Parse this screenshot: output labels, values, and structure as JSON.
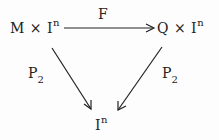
{
  "diagram": {
    "type": "commutative-triangle",
    "nodes": {
      "top_left": {
        "base": "M × I",
        "sup": "n"
      },
      "top_right": {
        "base": "Q × I",
        "sup": "n"
      },
      "bottom": {
        "base": "I",
        "sup": "n"
      }
    },
    "arrows": {
      "top": {
        "label": "F",
        "from": "top_left",
        "to": "top_right"
      },
      "left": {
        "label_base": "P",
        "label_sub": "2",
        "from": "top_left",
        "to": "bottom"
      },
      "right": {
        "label_base": "P",
        "label_sub": "2",
        "from": "top_right",
        "to": "bottom"
      }
    }
  }
}
